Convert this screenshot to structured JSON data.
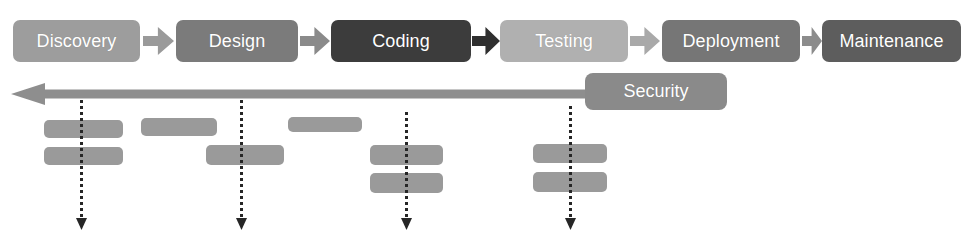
{
  "diagram": {
    "canvas": {
      "width": 971,
      "height": 238,
      "background": "#ffffff"
    },
    "stages": [
      {
        "label": "Discovery",
        "color": "#9d9d9d",
        "x": 13,
        "y": 20,
        "w": 127,
        "h": 42
      },
      {
        "label": "Design",
        "color": "#7b7b7b",
        "x": 176,
        "y": 20,
        "w": 122,
        "h": 42
      },
      {
        "label": "Coding",
        "color": "#3c3c3c",
        "x": 331,
        "y": 20,
        "w": 140,
        "h": 42
      },
      {
        "label": "Testing",
        "color": "#b0b0b0",
        "x": 500,
        "y": 20,
        "w": 128,
        "h": 42
      },
      {
        "label": "Deployment",
        "color": "#767676",
        "x": 662,
        "y": 20,
        "w": 138,
        "h": 42
      },
      {
        "label": "Maintenance",
        "color": "#5d5d5d",
        "x": 822,
        "y": 20,
        "w": 139,
        "h": 42
      }
    ],
    "connectors": [
      {
        "name": "discovery-to-design",
        "x": 143,
        "y": 27,
        "w": 31,
        "h": 28,
        "color": "#9a9a9a"
      },
      {
        "name": "design-to-coding",
        "x": 300,
        "y": 27,
        "w": 30,
        "h": 28,
        "color": "#8a8a8a"
      },
      {
        "name": "coding-to-testing",
        "x": 472,
        "y": 27,
        "w": 28,
        "h": 28,
        "color": "#2f2f2f"
      },
      {
        "name": "testing-to-deployment",
        "x": 630,
        "y": 27,
        "w": 30,
        "h": 28,
        "color": "#a9a9a9"
      },
      {
        "name": "deployment-to-maintenance",
        "x": 802,
        "y": 27,
        "w": 20,
        "h": 28,
        "color": "#8c8c8c"
      }
    ],
    "security": {
      "label": "Security",
      "box": {
        "color": "#8a8a8a",
        "x": 585,
        "y": 73,
        "w": 142,
        "h": 37
      },
      "arrow": {
        "color": "#8e8e8e",
        "x": 11,
        "y": 83,
        "w": 578,
        "h": 22,
        "direction": "left"
      }
    },
    "dotted_lines": [
      {
        "name": "dotted-arrow-1",
        "x": 81,
        "y_top": 100,
        "y_bottom": 230,
        "color": "#262626"
      },
      {
        "name": "dotted-arrow-2",
        "x": 241,
        "y_top": 100,
        "y_bottom": 230,
        "color": "#262626"
      },
      {
        "name": "dotted-arrow-3",
        "x": 406,
        "y_top": 112,
        "y_bottom": 230,
        "color": "#262626"
      },
      {
        "name": "dotted-arrow-4",
        "x": 570,
        "y_top": 106,
        "y_bottom": 230,
        "color": "#262626"
      }
    ],
    "placeholder_bars": [
      {
        "name": "bar-group1-row1",
        "x": 44,
        "y": 120,
        "w": 79,
        "h": 18,
        "color": "#9a9a9a"
      },
      {
        "name": "bar-group1-row2",
        "x": 44,
        "y": 147,
        "w": 79,
        "h": 18,
        "color": "#9a9a9a"
      },
      {
        "name": "bar-group2-row1",
        "x": 141,
        "y": 118,
        "w": 76,
        "h": 18,
        "color": "#9a9a9a"
      },
      {
        "name": "bar-group2-row2",
        "x": 206,
        "y": 145,
        "w": 78,
        "h": 20,
        "color": "#9a9a9a"
      },
      {
        "name": "bar-group3-row1",
        "x": 288,
        "y": 117,
        "w": 74,
        "h": 15,
        "color": "#9a9a9a"
      },
      {
        "name": "bar-group3-row2",
        "x": 370,
        "y": 145,
        "w": 73,
        "h": 20,
        "color": "#9a9a9a"
      },
      {
        "name": "bar-group3-row3",
        "x": 370,
        "y": 173,
        "w": 73,
        "h": 20,
        "color": "#9a9a9a"
      },
      {
        "name": "bar-group4-row1",
        "x": 533,
        "y": 144,
        "w": 74,
        "h": 19,
        "color": "#9a9a9a"
      },
      {
        "name": "bar-group4-row2",
        "x": 533,
        "y": 172,
        "w": 74,
        "h": 20,
        "color": "#9a9a9a"
      }
    ]
  }
}
